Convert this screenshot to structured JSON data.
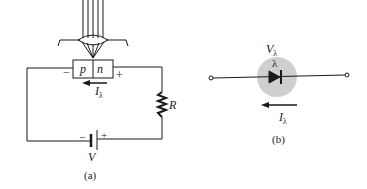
{
  "figure_a": {
    "caption": "(a)",
    "junction": {
      "p_label": "p",
      "n_label": "n"
    },
    "junction_minus": "−",
    "junction_plus": "+",
    "current_label": "I",
    "current_subscript": "λ",
    "resistor_label": "R",
    "battery_label": "V",
    "battery_minus": "−",
    "battery_plus": "+"
  },
  "figure_b": {
    "caption": "(b)",
    "voltage_label": "V",
    "voltage_subscript": "λ",
    "light_label": "λ",
    "current_label": "I",
    "current_subscript": "λ",
    "highlight_color": "#cfcfcf"
  },
  "colors": {
    "line": "#1a1a1a",
    "background": "#ffffff"
  }
}
